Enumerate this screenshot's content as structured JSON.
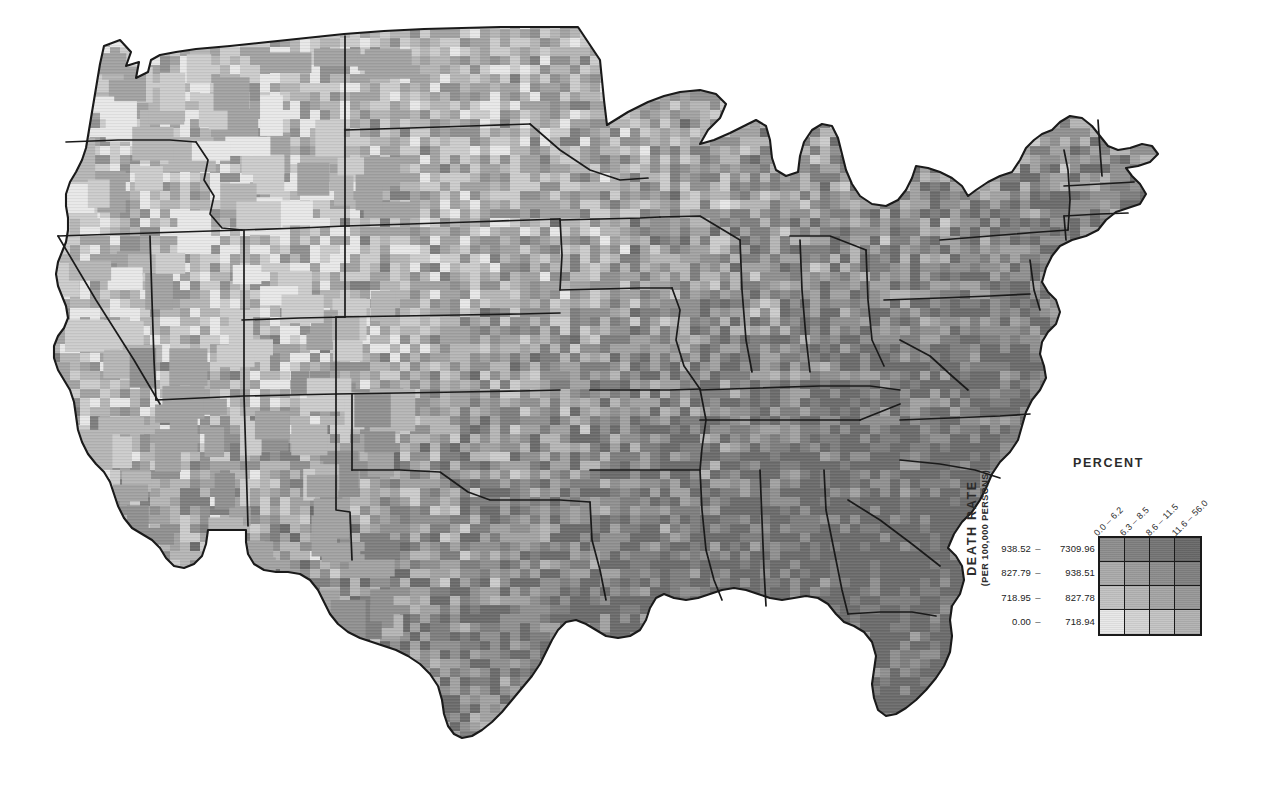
{
  "figure": {
    "kind": "bivariate-choropleth-map",
    "region": "Contiguous United States",
    "unit": "county",
    "background_color": "#ffffff",
    "boundary_color": "#1a1a1a"
  },
  "legend": {
    "percent_axis": {
      "title": "PERCENT",
      "classes": [
        {
          "label": "0.0  –  6.2",
          "low": "0.0",
          "high": "6.2"
        },
        {
          "label": "6.3  –  8.5",
          "low": "6.3",
          "high": "8.5"
        },
        {
          "label": "8.6  –  11.5",
          "low": "8.6",
          "high": "11.5"
        },
        {
          "label": "11.6  –  56.0",
          "low": "11.6",
          "high": "56.0"
        }
      ]
    },
    "death_rate_axis": {
      "title": "DEATH RATE",
      "units": "(PER 100,000 PERSONS)",
      "classes": [
        {
          "low": "938.52",
          "dash": "–",
          "high": "7309.96"
        },
        {
          "low": "827.79",
          "dash": "–",
          "high": "938.51"
        },
        {
          "low": "718.95",
          "dash": "–",
          "high": "827.78"
        },
        {
          "low": "0.00",
          "dash": "–",
          "high": "718.94"
        }
      ]
    },
    "matrix_colors": [
      [
        "#8e8e8e",
        "#808080",
        "#757575",
        "#696969"
      ],
      [
        "#ababab",
        "#9c9c9c",
        "#8d8d8d",
        "#818181"
      ],
      [
        "#c2c2c2",
        "#b4b4b4",
        "#a5a5a5",
        "#989898"
      ],
      [
        "#e8e8e8",
        "#d4d4d4",
        "#c4c4c4",
        "#b2b2b2"
      ]
    ],
    "matrix_border_color": "#1a1a1a"
  },
  "map_palette": {
    "lightest": "#e8e8e8",
    "light": "#cccccc",
    "medium_light": "#b6b6b6",
    "medium": "#a3a3a3",
    "medium_dark": "#919191",
    "dark": "#808080",
    "darkest": "#6d6d6d",
    "outline": "#1a1a1a"
  }
}
